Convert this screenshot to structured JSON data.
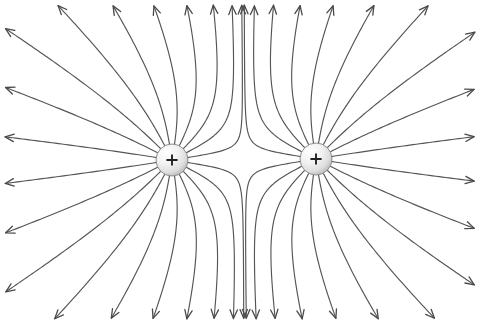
{
  "figure": {
    "background_color": "#ffffff",
    "width": 480,
    "height": 324,
    "line_color": "#555555",
    "arrow_color": "#4a4a4a",
    "charge_outline_color": "#8f8f8f",
    "charge_sign_color": "#222222",
    "charge_fill_light": "#ffffff",
    "charge_fill_dark": "#b9b9b9"
  },
  "charges": [
    {
      "id": "left-charge",
      "label": "+",
      "sign": "positive",
      "cx": 172,
      "cy": 160,
      "r": 16,
      "line_count": 20
    },
    {
      "id": "right-charge",
      "label": "+",
      "sign": "positive",
      "cx": 316,
      "cy": 159,
      "r": 16,
      "line_count": 20
    }
  ],
  "chart_data": {
    "type": "line",
    "xlabel": "",
    "ylabel": "",
    "xlim": [
      0,
      480
    ],
    "ylim": [
      0,
      324
    ],
    "grid": false,
    "legend": "none",
    "annotations": [
      "Left charge marked +",
      "Right charge marked +",
      "Field lines point outward (arrowheads at outer ends)",
      "Saddle point with no field lines at midpoint between charges"
    ],
    "series": [
      {
        "name": "left-charge-field-lines",
        "origin": [
          172,
          160
        ],
        "count": 20,
        "description": "Field lines radiating outward from the left positive charge, bending away from the right charge near the midline"
      },
      {
        "name": "right-charge-field-lines",
        "origin": [
          316,
          159
        ],
        "count": 20,
        "description": "Field lines radiating outward from the right positive charge, bending away from the left charge near the midline"
      }
    ]
  }
}
